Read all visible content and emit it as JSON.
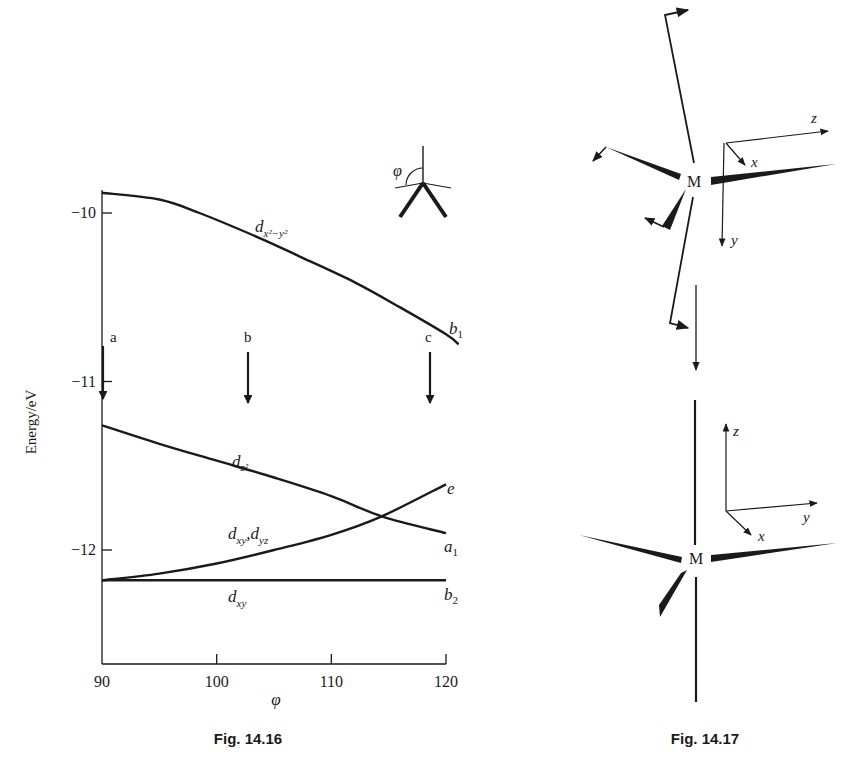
{
  "chart_data": [
    {
      "figure": "Fig. 14.16",
      "type": "line",
      "title": "",
      "xlabel": "φ",
      "ylabel": "Energy/eV",
      "xlim": [
        90,
        121
      ],
      "ylim": [
        -12.68,
        -9.8
      ],
      "x_ticks": [
        90,
        100,
        110,
        120
      ],
      "x_tick_labels": [
        "90",
        "100",
        "110",
        "120"
      ],
      "y_ticks": [
        -10,
        -11,
        -12
      ],
      "y_tick_labels": [
        "−10",
        "−11",
        "−12"
      ],
      "grid": false,
      "legend": "none (curves labelled directly)",
      "series": [
        {
          "name": "d_{x²−y²}",
          "end_label": "b1",
          "x": [
            90,
            95,
            98.5,
            103.8,
            107.3,
            112,
            116,
            120,
            121.1
          ],
          "y": [
            -9.88,
            -9.92,
            -10.0,
            -10.15,
            -10.26,
            -10.41,
            -10.56,
            -10.72,
            -10.78
          ]
        },
        {
          "name": "d_{z²}",
          "end_label": "a1",
          "x": [
            90,
            95,
            100,
            105,
            110,
            114.4,
            120
          ],
          "y": [
            -11.26,
            -11.37,
            -11.47,
            -11.57,
            -11.68,
            -11.8,
            -11.9
          ]
        },
        {
          "name": "d_{xz}, d_{yz}",
          "end_label": "e",
          "x": [
            90,
            95,
            100,
            105,
            110,
            114.4,
            120
          ],
          "y": [
            -12.18,
            -12.14,
            -12.08,
            -12.0,
            -11.91,
            -11.8,
            -11.61
          ]
        },
        {
          "name": "d_{xy}",
          "end_label": "b2",
          "x": [
            90,
            120
          ],
          "y": [
            -12.18,
            -12.18
          ]
        }
      ],
      "annotations": [
        {
          "label": "a",
          "type": "down-arrow",
          "x": 90
        },
        {
          "label": "b",
          "type": "down-arrow",
          "x": 102.3
        },
        {
          "label": "c",
          "type": "down-arrow",
          "x": 118.2
        },
        {
          "label": "φ",
          "type": "inset-geometry-icon"
        }
      ]
    },
    {
      "figure": "Fig. 14.17",
      "type": "diagram",
      "upper": {
        "center_label": "M",
        "axes": [
          "z",
          "x",
          "y"
        ]
      },
      "lower": {
        "center_label": "M",
        "axes": [
          "z",
          "y",
          "x"
        ]
      }
    }
  ],
  "fig1": {
    "caption": "Fig. 14.16",
    "ylabel": "Energy/eV",
    "xlabel": "φ",
    "inset_phi": "φ",
    "curve_labels": {
      "dx2y2": "d",
      "dx2y2_sub": "x²−y²",
      "dz2": "d",
      "dz2_sub": "z²",
      "dxzyz_d1": "d",
      "dxzyz_s1": "xy",
      "dxzyz_sep": ",",
      "dxzyz_d2": "d",
      "dxzyz_s2": "yz",
      "dxy": "d",
      "dxy_sub": "xy"
    },
    "end_labels": {
      "b1": "b",
      "b1_sub": "1",
      "a1": "a",
      "a1_sub": "1",
      "e": "e",
      "b2": "b",
      "b2_sub": "2"
    },
    "arrows": {
      "a": "a",
      "b": "b",
      "c": "c"
    }
  },
  "fig2": {
    "caption": "Fig. 14.17",
    "upper_center": "M",
    "upper_axes": {
      "z": "z",
      "x": "x",
      "y": "y"
    },
    "lower_center": "M",
    "lower_axes": {
      "z": "z",
      "y": "y",
      "x": "x"
    }
  },
  "colors": {
    "ink": "#1a1a1a",
    "background": "#ffffff"
  }
}
